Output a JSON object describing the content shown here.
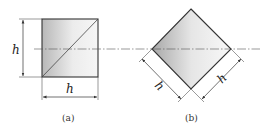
{
  "figure": {
    "panels": [
      {
        "id": "a",
        "caption": "(a)",
        "shape": "square",
        "dimension_labels": {
          "height": "h",
          "width": "h"
        }
      },
      {
        "id": "b",
        "caption": "(b)",
        "shape": "diamond",
        "dimension_labels": {
          "lower_left_side": "h",
          "lower_right_side": "h"
        }
      }
    ],
    "centerline": "dash-dot horizontal axis",
    "colors": {
      "outline": "#333333",
      "fill_dark": "#bdbdbd",
      "fill_light": "#f4f4f4",
      "dimension_line": "#444444"
    }
  }
}
